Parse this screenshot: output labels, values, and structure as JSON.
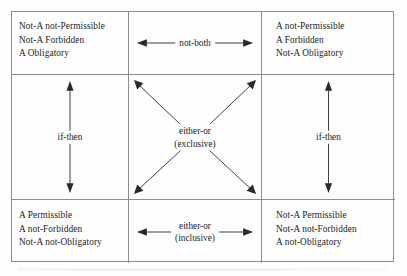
{
  "diagram": {
    "border_color": "#8d8d8d",
    "arrow_color": "#2a2a2a",
    "background_color": "#fefefe",
    "cells": {
      "top_left": {
        "lines": [
          "Not-A not-Permissible",
          "Not-A Forbidden",
          "A Obligatory"
        ]
      },
      "top_center": {
        "label_lines": [
          "not-both"
        ],
        "arrow": "double-horizontal"
      },
      "top_right": {
        "lines": [
          "A not-Permissible",
          "A Forbidden",
          "Not-A Obligatory"
        ]
      },
      "middle_left": {
        "label_lines": [
          "if-then"
        ],
        "arrow": "double-vertical"
      },
      "middle_center": {
        "label_lines": [
          "either-or",
          "(exclusive)"
        ],
        "arrow": "double-diagonal-x"
      },
      "middle_right": {
        "label_lines": [
          "if-then"
        ],
        "arrow": "double-vertical"
      },
      "bottom_left": {
        "lines": [
          "A Permissible",
          "A not-Forbidden",
          "Not-A not-Obligatory"
        ]
      },
      "bottom_center": {
        "label_lines": [
          "either-or",
          "(inclusive)"
        ],
        "arrow": "double-horizontal"
      },
      "bottom_right": {
        "lines": [
          "Not-A Permissible",
          "Not-A not-Forbidden",
          "A not-Obligatory"
        ]
      }
    }
  }
}
